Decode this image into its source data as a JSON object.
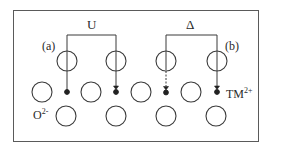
{
  "diagram": {
    "labels": {
      "coulomb": "U",
      "splitting": "Δ",
      "case_a": "(a)",
      "case_b": "(b)",
      "oxygen": "O",
      "oxygen_charge": "2-",
      "metal": "TM",
      "metal_charge": "2+"
    },
    "colors": {
      "line": "#3a3a3a",
      "frame": "#5a5a5a",
      "background": "#ffffff"
    },
    "brackets": [
      {
        "label": "U",
        "x1": 67,
        "x2": 116,
        "y": 35
      },
      {
        "label": "Δ",
        "x1": 166,
        "x2": 217,
        "y": 35
      }
    ],
    "orbital_circles_upper": [
      {
        "x": 67,
        "y": 60
      },
      {
        "x": 116,
        "y": 60
      },
      {
        "x": 166,
        "y": 60
      },
      {
        "x": 217,
        "y": 60
      }
    ],
    "oxygen_circles_middle": [
      {
        "x": 42,
        "y": 92
      },
      {
        "x": 91,
        "y": 92
      },
      {
        "x": 141,
        "y": 92
      },
      {
        "x": 191,
        "y": 92
      }
    ],
    "oxygen_circles_lower": [
      {
        "x": 66,
        "y": 116
      },
      {
        "x": 116,
        "y": 116
      },
      {
        "x": 166,
        "y": 116
      },
      {
        "x": 216,
        "y": 116
      }
    ],
    "electron_markers": [
      {
        "x": 67,
        "type": "single-dot"
      },
      {
        "x": 116,
        "type": "double-dot"
      },
      {
        "x": 166,
        "type": "dashed-double-dot"
      },
      {
        "x": 217,
        "type": "double-dot"
      }
    ]
  }
}
